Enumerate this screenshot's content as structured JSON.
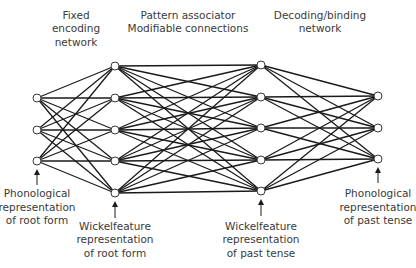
{
  "colors": {
    "background": "#ffffff",
    "line": "#1a1a1a",
    "node_fill": "#ffffff",
    "node_stroke": "#3a3a3a",
    "text": "#3a3a3a"
  },
  "layers": [
    {
      "id": "phonological-root",
      "x": 37,
      "nodes": [
        98,
        130,
        161
      ],
      "label": [
        "Phonological",
        "representation",
        "of root form"
      ],
      "label_y": [
        197,
        211,
        224
      ],
      "arrow": [
        185,
        172
      ]
    },
    {
      "id": "wickelfeature-root",
      "x": 115,
      "nodes": [
        66,
        98,
        130,
        161,
        193
      ],
      "label": [
        "Wickelfeature",
        "representation",
        "of root form"
      ],
      "label_y": [
        230,
        243,
        257
      ],
      "arrow": [
        218,
        204
      ]
    },
    {
      "id": "wickelfeature-past",
      "x": 261,
      "nodes": [
        65,
        97,
        128,
        160,
        191
      ],
      "label": [
        "Wickelfeature",
        "representation",
        "of past tense"
      ],
      "label_y": [
        230,
        243,
        257
      ],
      "arrow": [
        216,
        202
      ]
    },
    {
      "id": "phonological-past",
      "x": 378,
      "nodes": [
        96,
        128,
        159
      ],
      "label": [
        "Phonological",
        "representation",
        "of past tense"
      ],
      "label_y": [
        197,
        211,
        224
      ],
      "arrow": [
        183,
        170
      ]
    }
  ],
  "sections": [
    {
      "id": "fixed-encoding-network",
      "x": 76,
      "lines": [
        "Fixed",
        "encoding",
        "network"
      ],
      "y": [
        19,
        32,
        46
      ]
    },
    {
      "id": "pattern-associator",
      "x": 188,
      "lines": [
        "Pattern associator",
        "Modifiable connections"
      ],
      "y": [
        19,
        32
      ]
    },
    {
      "id": "decoding-binding-network",
      "x": 320,
      "lines": [
        "Decoding/binding",
        "network"
      ],
      "y": [
        19,
        32
      ]
    }
  ],
  "node_radius": 4
}
